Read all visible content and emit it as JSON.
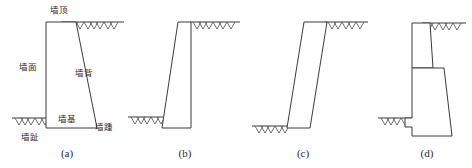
{
  "figure": {
    "type": "engineering-diagram",
    "panels": [
      {
        "caption": "(a)",
        "labels": {
          "top": "墙顶",
          "face": "墙面",
          "back": "墙背",
          "base": "墙基",
          "heel": "墙踵",
          "toe": "墙趾"
        }
      },
      {
        "caption": "(b)",
        "labels": {}
      },
      {
        "caption": "(c)",
        "labels": {}
      },
      {
        "caption": "(d)",
        "labels": {}
      }
    ]
  },
  "colors": {
    "line": "#3a3a3a",
    "hatch": "#4a4a4a",
    "text": "#2b2b2b",
    "background": "#ffffff"
  }
}
